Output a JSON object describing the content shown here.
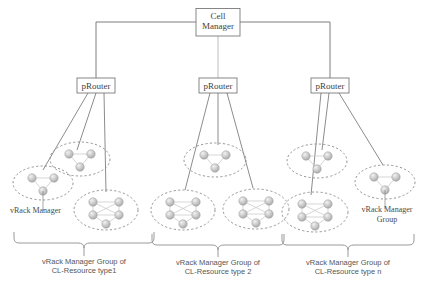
{
  "diagram": {
    "colors": {
      "line": "#6f6f6f",
      "box_border": "#7a7a7a",
      "box_fill": "#ffffff",
      "ellipse_dash": "#8a8a8a",
      "node_fill": "#c9c9c9",
      "node_edge": "#9a9a9a",
      "text": "#3f3f3f",
      "caption_text": "#565656",
      "background": "#ffffff"
    },
    "root": {
      "label_line1": "Cell",
      "label_line2": "Manager",
      "name": "cell-manager"
    },
    "routers": [
      {
        "label": "pRouter",
        "name": "prouter-1"
      },
      {
        "label": "pRouter",
        "name": "prouter-2"
      },
      {
        "label": "pRouter",
        "name": "prouter-3"
      }
    ],
    "groups": [
      {
        "name": "vrack-manager-group-type1",
        "caption_line1": "vRack Manager Group of",
        "caption_line2": "CL-Resource type1",
        "clusters": [
          {
            "name": "vrack-manager-cluster-a",
            "nodes": 3
          },
          {
            "name": "vrack-manager-cluster-b",
            "nodes": 3
          },
          {
            "name": "vrack-manager-cluster-c",
            "nodes": 5
          }
        ]
      },
      {
        "name": "vrack-manager-group-type2",
        "caption_line1": "vRack Manager Group of",
        "caption_line2": "CL-Resource type 2",
        "clusters": [
          {
            "name": "vrack-manager-cluster-d",
            "nodes": 3
          },
          {
            "name": "vrack-manager-cluster-e",
            "nodes": 5
          },
          {
            "name": "vrack-manager-cluster-f",
            "nodes": 5
          }
        ]
      },
      {
        "name": "vrack-manager-group-typen",
        "caption_line1": "vRack Manager Group of",
        "caption_line2": "CL-Resource type n",
        "clusters": [
          {
            "name": "vrack-manager-cluster-g",
            "nodes": 3
          },
          {
            "name": "vrack-manager-cluster-h",
            "nodes": 5
          },
          {
            "name": "vrack-manager-cluster-i",
            "nodes": 3
          }
        ]
      }
    ],
    "annotations": {
      "vrack_manager_label": "vRack Manager",
      "vrack_manager_group_line1": "vRack Manager",
      "vrack_manager_group_line2": "Group"
    }
  }
}
